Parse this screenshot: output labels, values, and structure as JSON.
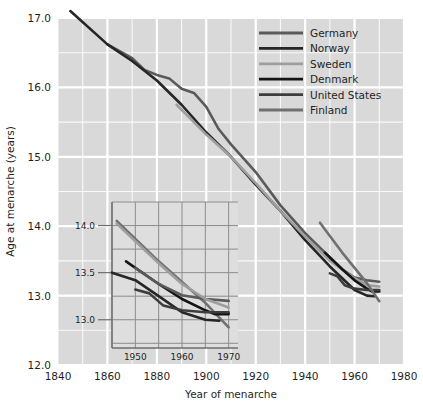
{
  "chart_data": {
    "type": "line",
    "title": "",
    "xlabel": "Year of menarche",
    "ylabel": "Age at menarche (years)",
    "xlim": [
      1840,
      1980
    ],
    "ylim": [
      12.0,
      17.0
    ],
    "xticks": [
      1840,
      1860,
      1880,
      1900,
      1920,
      1940,
      1960,
      1980
    ],
    "yticks": [
      12.0,
      13.0,
      14.0,
      15.0,
      16.0,
      17.0
    ],
    "xtick_labels": [
      "1840",
      "1860",
      "1880",
      "1900",
      "1920",
      "1940",
      "1960",
      "1980"
    ],
    "ytick_labels": [
      "12.0",
      "13.0",
      "14.0",
      "15.0",
      "16.0",
      "17.0"
    ],
    "grid": true,
    "grid_minor_step_x": 10,
    "grid_minor_step_y": 0.5,
    "legend_position": "top-right",
    "background_color": "#d9d9d9",
    "grid_color": "#ffffff",
    "series": [
      {
        "name": "Germany",
        "color": "#5a5a5a",
        "points": [
          [
            1860,
            16.62
          ],
          [
            1870,
            16.42
          ],
          [
            1875,
            16.25
          ],
          [
            1880,
            16.18
          ],
          [
            1885,
            16.13
          ],
          [
            1890,
            15.98
          ],
          [
            1895,
            15.92
          ],
          [
            1900,
            15.72
          ],
          [
            1905,
            15.4
          ],
          [
            1910,
            15.18
          ],
          [
            1920,
            14.78
          ],
          [
            1930,
            14.3
          ],
          [
            1940,
            13.9
          ],
          [
            1950,
            13.55
          ],
          [
            1955,
            13.38
          ],
          [
            1960,
            13.26
          ],
          [
            1965,
            13.22
          ],
          [
            1970,
            13.2
          ]
        ]
      },
      {
        "name": "Norway",
        "color": "#262626",
        "points": [
          [
            1845,
            17.1
          ],
          [
            1860,
            16.62
          ],
          [
            1870,
            16.38
          ],
          [
            1880,
            16.1
          ],
          [
            1890,
            15.75
          ],
          [
            1900,
            15.35
          ],
          [
            1910,
            15.0
          ],
          [
            1920,
            14.6
          ],
          [
            1930,
            14.22
          ],
          [
            1940,
            13.8
          ],
          [
            1950,
            13.42
          ],
          [
            1955,
            13.25
          ],
          [
            1960,
            13.08
          ],
          [
            1965,
            13.0
          ],
          [
            1968,
            12.99
          ]
        ]
      },
      {
        "name": "Sweden",
        "color": "#9e9e9e",
        "points": [
          [
            1888,
            15.75
          ],
          [
            1900,
            15.32
          ],
          [
            1910,
            15.0
          ],
          [
            1920,
            14.62
          ],
          [
            1930,
            14.22
          ],
          [
            1940,
            13.85
          ],
          [
            1950,
            13.5
          ],
          [
            1960,
            13.25
          ],
          [
            1965,
            13.15
          ],
          [
            1970,
            13.13
          ]
        ]
      },
      {
        "name": "Denmark",
        "color": "#141414",
        "points": [
          [
            1948,
            13.62
          ],
          [
            1955,
            13.38
          ],
          [
            1960,
            13.22
          ],
          [
            1965,
            13.1
          ],
          [
            1967,
            13.06
          ],
          [
            1970,
            13.06
          ]
        ]
      },
      {
        "name": "United States",
        "color": "#3d3d3d",
        "points": [
          [
            1950,
            13.32
          ],
          [
            1953,
            13.28
          ],
          [
            1956,
            13.15
          ],
          [
            1960,
            13.1
          ],
          [
            1965,
            13.08
          ],
          [
            1970,
            13.08
          ]
        ]
      },
      {
        "name": "Finland",
        "color": "#707070",
        "points": [
          [
            1946,
            14.05
          ],
          [
            1955,
            13.62
          ],
          [
            1960,
            13.4
          ],
          [
            1965,
            13.18
          ],
          [
            1970,
            12.92
          ]
        ]
      }
    ],
    "inset": {
      "xlim": [
        1945,
        1972
      ],
      "ylim": [
        12.7,
        14.25
      ],
      "xticks": [
        1950,
        1960,
        1970
      ],
      "yticks": [
        13.0,
        13.5,
        14.0
      ],
      "xtick_labels": [
        "1950",
        "1960",
        "1970"
      ],
      "ytick_labels": [
        "13.0",
        "13.5",
        "14.0"
      ],
      "background_color": "#dedede",
      "grid_color": "#8c8c8c",
      "grid_minor_step_x": 5,
      "grid_minor_step_y": 0.25,
      "series": [
        {
          "name": "Finland",
          "color": "#707070",
          "points": [
            [
              1946,
              14.05
            ],
            [
              1955,
              13.62
            ],
            [
              1960,
              13.4
            ],
            [
              1965,
              13.18
            ],
            [
              1970,
              12.92
            ]
          ]
        },
        {
          "name": "Denmark",
          "color": "#141414",
          "points": [
            [
              1948,
              13.62
            ],
            [
              1955,
              13.38
            ],
            [
              1960,
              13.22
            ],
            [
              1965,
              13.1
            ],
            [
              1967,
              13.06
            ],
            [
              1970,
              13.06
            ]
          ]
        },
        {
          "name": "Norway",
          "color": "#262626",
          "points": [
            [
              1945,
              13.5
            ],
            [
              1950,
              13.42
            ],
            [
              1955,
              13.25
            ],
            [
              1960,
              13.08
            ],
            [
              1965,
              13.0
            ],
            [
              1968,
              12.99
            ]
          ]
        },
        {
          "name": "Germany",
          "color": "#5a5a5a",
          "points": [
            [
              1950,
              13.55
            ],
            [
              1955,
              13.38
            ],
            [
              1960,
              13.26
            ],
            [
              1965,
              13.22
            ],
            [
              1970,
              13.2
            ]
          ]
        },
        {
          "name": "Sweden",
          "color": "#9e9e9e",
          "points": [
            [
              1946,
              14.02
            ],
            [
              1955,
              13.6
            ],
            [
              1960,
              13.38
            ],
            [
              1965,
              13.22
            ],
            [
              1970,
              13.13
            ]
          ]
        },
        {
          "name": "United States",
          "color": "#3d3d3d",
          "points": [
            [
              1950,
              13.32
            ],
            [
              1953,
              13.28
            ],
            [
              1956,
              13.15
            ],
            [
              1960,
              13.1
            ],
            [
              1965,
              13.08
            ],
            [
              1970,
              13.08
            ]
          ]
        }
      ]
    }
  },
  "legend": {
    "items": [
      {
        "label": "Germany",
        "color": "#5a5a5a"
      },
      {
        "label": "Norway",
        "color": "#262626"
      },
      {
        "label": "Sweden",
        "color": "#9e9e9e"
      },
      {
        "label": "Denmark",
        "color": "#141414"
      },
      {
        "label": "United States",
        "color": "#3d3d3d"
      },
      {
        "label": "Finland",
        "color": "#707070"
      }
    ]
  },
  "axes": {
    "x_title": "Year of menarche",
    "y_title": "Age at menarche (years)"
  }
}
